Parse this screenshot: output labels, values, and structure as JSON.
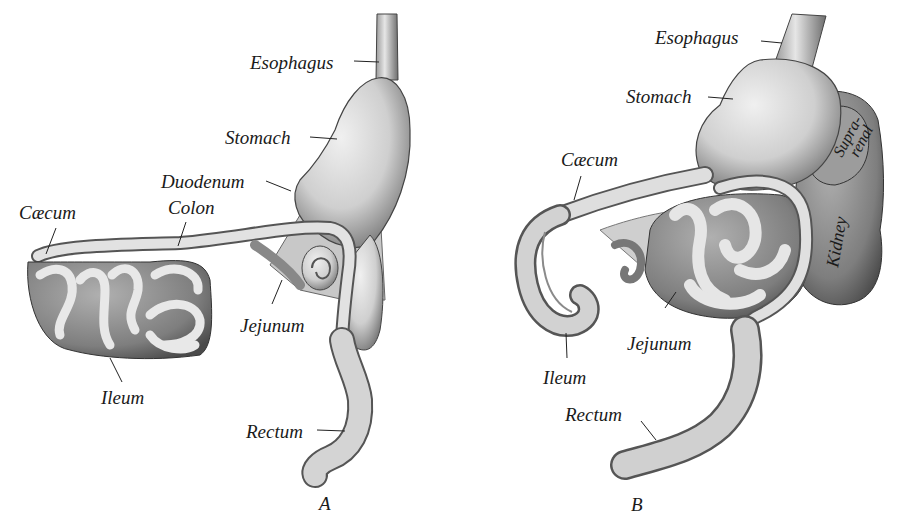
{
  "figure": {
    "panels": [
      {
        "id": "A",
        "letter": "A",
        "labels": {
          "esophagus": "Esophagus",
          "stomach": "Stomach",
          "duodenum": "Duodenum",
          "caecum": "Cæcum",
          "colon": "Colon",
          "jejunum": "Jejunum",
          "ileum": "Ileum",
          "rectum": "Rectum"
        }
      },
      {
        "id": "B",
        "letter": "B",
        "labels": {
          "esophagus": "Esophagus",
          "stomach": "Stomach",
          "caecum": "Cæcum",
          "suprarenal_line1": "Supra-",
          "suprarenal_line2": "renal",
          "kidney": "Kidney",
          "jejunum": "Jejunum",
          "ileum": "Ileum",
          "rectum": "Rectum"
        }
      }
    ],
    "colors": {
      "background": "#ffffff",
      "organ_fill": "#d6d6d6",
      "organ_shade": "#8c8c8c",
      "outline": "#3a3a3a",
      "text": "#1a1a1a"
    }
  }
}
